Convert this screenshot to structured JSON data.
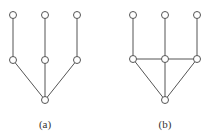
{
  "diagrams": [
    {
      "id": "a",
      "label": "(a)",
      "nodes": [
        {
          "id": "t1",
          "level": "top",
          "col": 0
        },
        {
          "id": "t2",
          "level": "top",
          "col": 1
        },
        {
          "id": "t3",
          "level": "top",
          "col": 2
        },
        {
          "id": "m1",
          "level": "middle",
          "col": 0
        },
        {
          "id": "m2",
          "level": "middle",
          "col": 1
        },
        {
          "id": "m3",
          "level": "middle",
          "col": 2
        },
        {
          "id": "r",
          "level": "bottom",
          "col": 1
        }
      ],
      "edges": [
        [
          "t1",
          "m1"
        ],
        [
          "t2",
          "m2"
        ],
        [
          "t3",
          "m3"
        ],
        [
          "m1",
          "r"
        ],
        [
          "m2",
          "r"
        ],
        [
          "m3",
          "r"
        ]
      ]
    },
    {
      "id": "b",
      "label": "(b)",
      "nodes": [
        {
          "id": "t1",
          "level": "top",
          "col": 0
        },
        {
          "id": "t2",
          "level": "top",
          "col": 1
        },
        {
          "id": "t3",
          "level": "top",
          "col": 2
        },
        {
          "id": "m1",
          "level": "middle",
          "col": 0
        },
        {
          "id": "m2",
          "level": "middle",
          "col": 1
        },
        {
          "id": "m3",
          "level": "middle",
          "col": 2
        },
        {
          "id": "r",
          "level": "bottom",
          "col": 1
        }
      ],
      "edges": [
        [
          "t1",
          "m1"
        ],
        [
          "t2",
          "m2"
        ],
        [
          "t3",
          "m3"
        ],
        [
          "m1",
          "r"
        ],
        [
          "m2",
          "r"
        ],
        [
          "m3",
          "r"
        ],
        [
          "m1",
          "m2"
        ],
        [
          "m2",
          "m3"
        ]
      ]
    }
  ]
}
